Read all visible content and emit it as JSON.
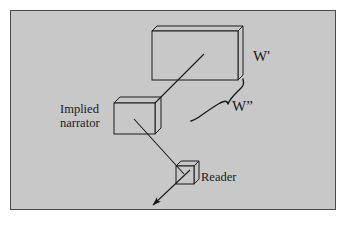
{
  "figure": {
    "background_color": "#c8c8c8",
    "page_color": "#ffffff",
    "border_color": "#4a4a4a",
    "stroke_color": "#1a1a1a",
    "labels": {
      "world_prime": "W'",
      "world_double_prime": "W”",
      "implied_narrator_line1": "Implied",
      "implied_narrator_line2": "narrator",
      "reader": "Reader"
    },
    "nodes": [
      {
        "name": "w-prime-box",
        "label": "W'",
        "shape": "3d-rectangle",
        "front": {
          "x": 152,
          "y": 31,
          "width": 86,
          "height": 49
        },
        "depth_x": 5,
        "depth_y": -5
      },
      {
        "name": "implied-narrator-box",
        "label": "Implied narrator",
        "shape": "3d-rectangle",
        "front": {
          "x": 114,
          "y": 103,
          "width": 41,
          "height": 31
        },
        "depth_x": 6,
        "depth_y": -6
      },
      {
        "name": "reader-box",
        "label": "Reader",
        "shape": "3d-cube",
        "front": {
          "x": 176,
          "y": 166,
          "width": 18,
          "height": 18
        },
        "depth_x": 5,
        "depth_y": -5
      }
    ],
    "connectors": [
      {
        "name": "narrator-to-w-prime-line",
        "from": "implied-narrator-box",
        "to": "w-prime-box",
        "arrowhead": false,
        "points": "155,103 203,55"
      },
      {
        "name": "narrator-to-reader-arrow",
        "from": "implied-narrator-box",
        "to": "reader-box",
        "arrowhead": true,
        "points": "135,120 183,173"
      },
      {
        "name": "reader-outgoing-arrow",
        "from": "reader-box",
        "to": "viewer",
        "arrowhead": true,
        "points": "188,172 152,206"
      },
      {
        "name": "w-double-prime-brace",
        "from": "w-prime-box",
        "to": "w-double-prime-label",
        "arrowhead": false,
        "shape": "curly-brace"
      }
    ],
    "label_positions": {
      "w_prime": {
        "x": 253,
        "y": 60
      },
      "w_double_prime": {
        "x": 232,
        "y": 110
      },
      "implied_narrator": {
        "x": 60,
        "y": 112
      },
      "reader": {
        "x": 201,
        "y": 180
      }
    }
  }
}
